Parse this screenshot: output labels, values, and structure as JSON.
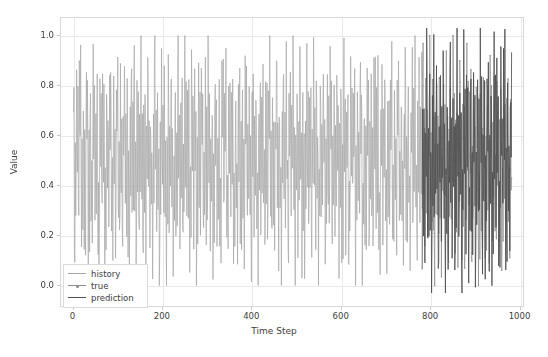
{
  "chart_data": {
    "type": "line",
    "title": "",
    "xlabel": "Time Step",
    "ylabel": "Value",
    "xlim": [
      -28,
      1010
    ],
    "ylim": [
      -0.09,
      1.07
    ],
    "xticks": [
      0,
      200,
      400,
      600,
      800,
      1000
    ],
    "xtick_labels": [
      "0",
      "200",
      "400",
      "600",
      "800",
      "1000"
    ],
    "yticks": [
      0.0,
      0.2,
      0.4,
      0.6,
      0.8,
      1.0
    ],
    "ytick_labels": [
      "0.0",
      "0.2",
      "0.4",
      "0.6",
      "0.8",
      "1.0"
    ],
    "grid": true,
    "legend_position": "lower left",
    "series": [
      {
        "name": "history",
        "color": "#a6a6a6",
        "marker": "none",
        "x_range": [
          0,
          780
        ],
        "n_points": 781,
        "y_min": 0.0,
        "y_max": 1.0,
        "y_mean": 0.5,
        "description": "dense high-frequency oscillation filling 0.0 to 1.0"
      },
      {
        "name": "true",
        "color": "#8c8c8c",
        "marker": "dot",
        "x_range": [
          780,
          980
        ],
        "n_points": 201,
        "y_min": -0.05,
        "y_max": 1.0,
        "y_mean": 0.5,
        "description": "dense oscillation overlapped with prediction in forecast window"
      },
      {
        "name": "prediction",
        "color": "#4f4f4f",
        "marker": "none",
        "x_range": [
          780,
          980
        ],
        "n_points": 201,
        "y_min": -0.06,
        "y_max": 1.0,
        "y_mean": 0.5,
        "description": "dark dense oscillation over the forecast window"
      }
    ],
    "legend": [
      {
        "label": "history",
        "color": "#a6a6a6",
        "marker": false
      },
      {
        "label": "true",
        "color": "#8c8c8c",
        "marker": true
      },
      {
        "label": "prediction",
        "color": "#4f4f4f",
        "marker": false
      }
    ]
  },
  "colors": {
    "background": "#ffffff",
    "grid": "#e9e9e9",
    "frame": "#d8d8d8",
    "tick_text": "#3c3c3c",
    "history": "#a6a6a6",
    "true": "#8c8c8c",
    "prediction": "#4f4f4f"
  }
}
